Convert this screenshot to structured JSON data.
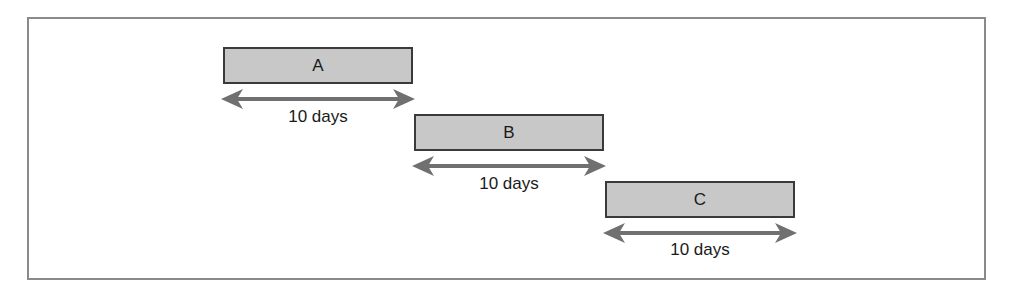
{
  "diagram": {
    "type": "sequential-task-timeline",
    "tasks": [
      {
        "label": "A",
        "duration": "10 days"
      },
      {
        "label": "B",
        "duration": "10 days"
      },
      {
        "label": "C",
        "duration": "10 days"
      }
    ],
    "colors": {
      "bar_fill": "#c8c8c8",
      "bar_border": "#3a3a3a",
      "arrow": "#707070",
      "frame": "#8a8a8a"
    }
  }
}
